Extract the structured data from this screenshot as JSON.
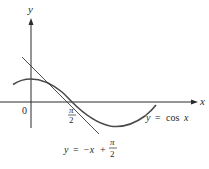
{
  "diagram": {
    "x_axis_label": "x",
    "y_axis_label": "y",
    "origin_label": "0",
    "tick_label_num": "π",
    "tick_label_den": "2",
    "curve_label_lhs": "y",
    "curve_label_eq": "=",
    "curve_label_rhs": "cos",
    "curve_label_var": "x",
    "tangent_label_lhs": "y",
    "tangent_label_eq": "=",
    "tangent_label_mid": "−x",
    "tangent_label_plus": "+",
    "tangent_label_num": "π",
    "tangent_label_den": "2",
    "colors": {
      "axis": "#2a2a2a",
      "curve": "#4a4a4a",
      "tangent": "#3a3a3a",
      "text": "#2a2a2a"
    }
  }
}
